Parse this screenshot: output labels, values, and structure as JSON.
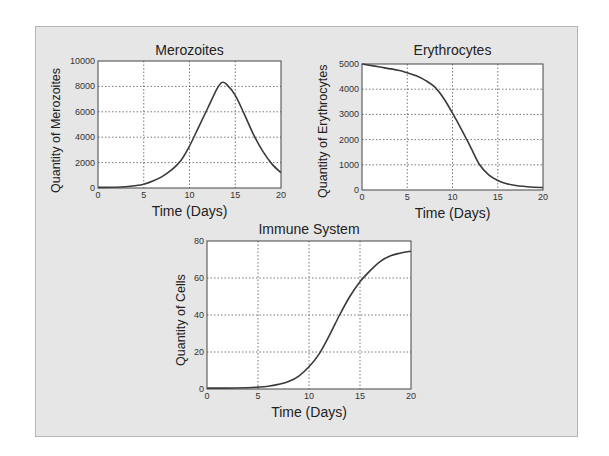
{
  "chart_data": [
    {
      "type": "line",
      "title": "Merozoites",
      "xlabel": "Time (Days)",
      "ylabel": "Quantity of Merozoites",
      "xlim": [
        0,
        20
      ],
      "ylim": [
        0,
        10000
      ],
      "xticks": [
        0,
        5,
        10,
        15,
        20
      ],
      "yticks": [
        0,
        2000,
        4000,
        6000,
        8000,
        10000
      ],
      "grid": true,
      "legend": null,
      "series": [
        {
          "name": "Merozoites",
          "x": [
            0,
            2,
            3,
            4,
            5,
            6,
            7,
            8,
            9,
            10,
            11,
            12,
            13,
            13.5,
            14,
            15,
            16,
            17,
            18,
            19,
            20
          ],
          "y": [
            50,
            60,
            100,
            180,
            300,
            550,
            900,
            1400,
            2100,
            3300,
            4800,
            6300,
            7800,
            8300,
            8200,
            7300,
            5800,
            4200,
            2900,
            1900,
            1200
          ]
        }
      ]
    },
    {
      "type": "line",
      "title": "Erythrocytes",
      "xlabel": "Time (Days)",
      "ylabel": "Quantity of Erythrocytes",
      "xlim": [
        0,
        20
      ],
      "ylim": [
        0,
        5000
      ],
      "xticks": [
        0,
        5,
        10,
        15,
        20
      ],
      "yticks": [
        0,
        1000,
        2000,
        3000,
        4000,
        5000
      ],
      "grid": true,
      "legend": null,
      "series": [
        {
          "name": "Erythrocytes",
          "x": [
            0,
            2,
            4,
            5,
            6,
            7,
            8,
            9,
            10,
            11,
            12,
            13,
            14,
            15,
            16,
            17,
            18,
            19,
            20
          ],
          "y": [
            5000,
            4880,
            4750,
            4650,
            4530,
            4350,
            4100,
            3650,
            3050,
            2400,
            1700,
            1000,
            600,
            380,
            250,
            180,
            140,
            110,
            100
          ]
        }
      ]
    },
    {
      "type": "line",
      "title": "Immune System",
      "xlabel": "Time (Days)",
      "ylabel": "Quantity of Cells",
      "xlim": [
        0,
        20
      ],
      "ylim": [
        0,
        80
      ],
      "xticks": [
        0,
        5,
        10,
        15,
        20
      ],
      "yticks": [
        0,
        20,
        40,
        60,
        80
      ],
      "grid": true,
      "legend": null,
      "series": [
        {
          "name": "Immune System",
          "x": [
            0,
            2,
            4,
            5,
            6,
            7,
            8,
            9,
            10,
            11,
            12,
            13,
            14,
            15,
            16,
            17,
            18,
            19,
            20
          ],
          "y": [
            0.5,
            0.5,
            0.7,
            1,
            1.5,
            2.5,
            4,
            7,
            12,
            19,
            29,
            40,
            50,
            58,
            64,
            69,
            72,
            73.5,
            74.5
          ]
        }
      ]
    }
  ],
  "charts": {
    "merozoites": {
      "title": "Merozoites",
      "xlabel": "Time (Days)",
      "ylabel": "Quantity of Merozoites"
    },
    "erythrocytes": {
      "title": "Erythrocytes",
      "xlabel": "Time (Days)",
      "ylabel": "Quantity of Erythrocytes"
    },
    "immune": {
      "title": "Immune System",
      "xlabel": "Time (Days)",
      "ylabel": "Quantity of Cells"
    }
  },
  "colors": {
    "frame_bg": "#e6e6e6",
    "plot_bg": "#ffffff",
    "line": "#3a3a3a",
    "grid": "#555555"
  }
}
